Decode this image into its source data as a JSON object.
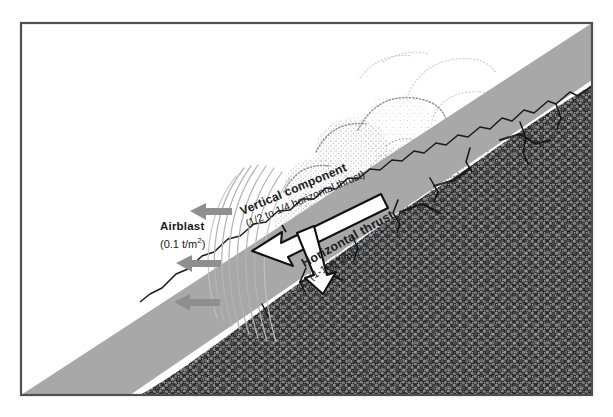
{
  "figure": {
    "frame": {
      "border_color": "#555555",
      "background_color": "#ffffff"
    },
    "colors": {
      "slope_gray": "#a8a8a8",
      "rock_dark": "#4a4a4a",
      "arrow_gray": "#8c8c8c",
      "wave_line": "#b0b0b0",
      "plume_stipple": "#909090",
      "text": "#1a1a1a",
      "arrow_outline": "#111111",
      "arrow_fill": "#ffffff"
    }
  },
  "labels": {
    "airblast": {
      "name": "Airblast",
      "value": "(0.1 t/m",
      "value_exp": "2",
      "value_tail": ")",
      "full": "Airblast (0.1 t/m2)"
    },
    "vertical_component": {
      "name": "Vertical component",
      "value": "(1/2 to 1/4 horizontal thrust)",
      "full": "Vertical component (1/2 to 1/4 horizontal thrust)"
    },
    "horizontal_thrust": {
      "name": "Horizontal thrust",
      "value": "(1-100 t/m",
      "value_exp": "2",
      "value_tail": ")",
      "full": "Horizontal thrust (1-100 t/m2)"
    }
  },
  "elements": {
    "airblast_arrows_count": 3,
    "airblast_arrow_direction": "left",
    "wave_arcs_count": 6,
    "horizontal_thrust_arrow_direction": "left-down",
    "vertical_component_arrow_direction": "down",
    "plume_description": "stippled billowing debris cloud",
    "slope_description": "gray inclined slope surface",
    "bedrock_description": "dark textured rock mass"
  }
}
